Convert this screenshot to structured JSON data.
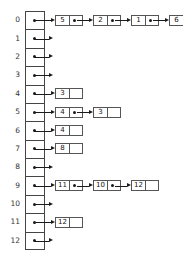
{
  "diagram": {
    "kind": "linked-list-bucket-array",
    "bucket_count": 13,
    "colors": {
      "background": "#ffffff",
      "stroke": "#444444",
      "node_stroke": "#555555",
      "pointer": "#1a1a1a",
      "text": "#222222"
    },
    "labels": [
      "0",
      "1",
      "2",
      "3",
      "4",
      "5",
      "6",
      "7",
      "8",
      "9",
      "10",
      "11",
      "12"
    ],
    "buckets": [
      {
        "index": "0",
        "chain": [
          "5",
          "2",
          "1",
          "6"
        ]
      },
      {
        "index": "1",
        "chain": []
      },
      {
        "index": "2",
        "chain": []
      },
      {
        "index": "3",
        "chain": []
      },
      {
        "index": "4",
        "chain": [
          "3"
        ]
      },
      {
        "index": "5",
        "chain": [
          "4",
          "3"
        ]
      },
      {
        "index": "6",
        "chain": [
          "4"
        ]
      },
      {
        "index": "7",
        "chain": [
          "8"
        ]
      },
      {
        "index": "8",
        "chain": []
      },
      {
        "index": "9",
        "chain": [
          "11",
          "10",
          "12"
        ]
      },
      {
        "index": "10",
        "chain": []
      },
      {
        "index": "11",
        "chain": [
          "12"
        ]
      },
      {
        "index": "12",
        "chain": []
      }
    ]
  }
}
